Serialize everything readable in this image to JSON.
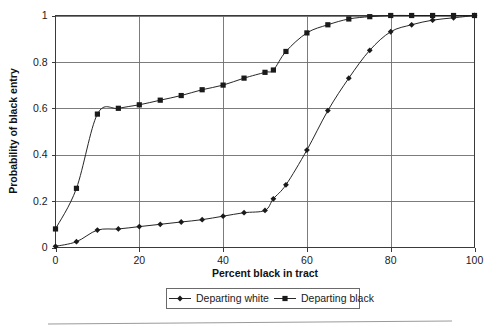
{
  "chart_data": {
    "type": "line",
    "title": "",
    "xlabel": "Percent black in tract",
    "ylabel": "Probability of black entry",
    "xlim": [
      0,
      100
    ],
    "ylim": [
      0,
      1
    ],
    "xticks": [
      0,
      20,
      40,
      60,
      80,
      100
    ],
    "yticks": [
      0,
      0.2,
      0.4,
      0.6,
      0.8,
      1
    ],
    "xtick_labels": [
      "0",
      "20",
      "40",
      "60",
      "80",
      "100"
    ],
    "ytick_labels": [
      "0",
      "0.2",
      "0.4",
      "0.6",
      "0.8",
      "1"
    ],
    "grid": "both",
    "legend_position": "bottom",
    "x": [
      0,
      5,
      10,
      15,
      20,
      25,
      30,
      35,
      40,
      45,
      50,
      52,
      55,
      60,
      65,
      70,
      75,
      80,
      85,
      90,
      95,
      100
    ],
    "series": [
      {
        "name": "Departing white",
        "marker": "diamond",
        "color": "#1a1a1a",
        "values": [
          0.005,
          0.025,
          0.075,
          0.08,
          0.09,
          0.1,
          0.11,
          0.12,
          0.135,
          0.15,
          0.16,
          0.21,
          0.27,
          0.42,
          0.59,
          0.73,
          0.85,
          0.93,
          0.96,
          0.98,
          0.99,
          1.0
        ]
      },
      {
        "name": "Departing black",
        "marker": "square",
        "color": "#1a1a1a",
        "values": [
          0.08,
          0.255,
          0.575,
          0.6,
          0.615,
          0.635,
          0.655,
          0.68,
          0.7,
          0.73,
          0.755,
          0.765,
          0.845,
          0.925,
          0.96,
          0.985,
          0.995,
          1.0,
          1.0,
          1.0,
          1.0,
          1.0
        ]
      }
    ]
  },
  "legend": {
    "entries": [
      {
        "label": "Departing white",
        "marker": "diamond"
      },
      {
        "label": "Departing black",
        "marker": "square"
      }
    ]
  },
  "axes": {
    "x_title": "Percent black in tract",
    "y_title": "Probability of black entry"
  }
}
